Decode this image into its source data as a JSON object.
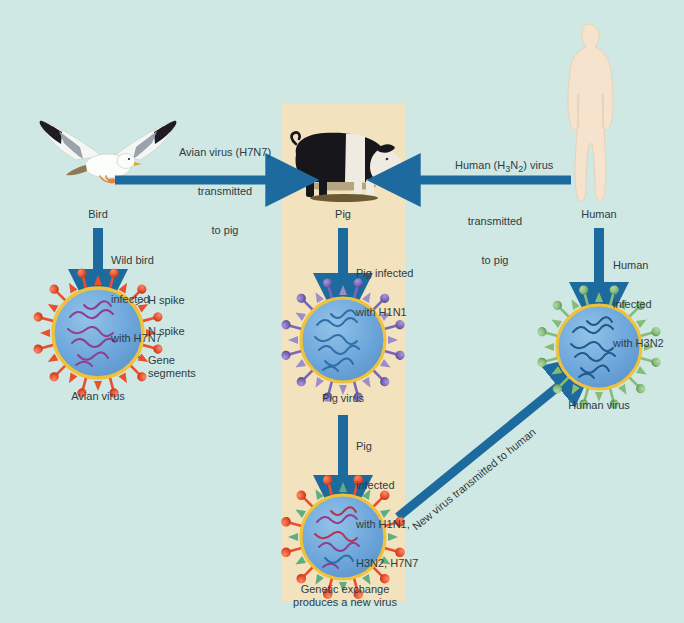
{
  "figure": {
    "background_color": "#cfe8e4",
    "panel_color": "#f2e2bd",
    "arrow_color": "#1c6a9e"
  },
  "organisms": [
    {
      "id": "bird",
      "label": "Bird",
      "icon": "seagull-icon"
    },
    {
      "id": "pig",
      "label": "Pig",
      "icon": "pig-icon"
    },
    {
      "id": "human",
      "label": "Human",
      "icon": "human-silhouette-icon"
    }
  ],
  "transmission_arrows": {
    "bird_to_pig": {
      "text_lines": [
        "Avian virus (H7N7)",
        "transmitted",
        "to pig"
      ],
      "direction": "right"
    },
    "human_to_pig": {
      "text_lines": [
        "Human (H",
        "3",
        "N",
        "2",
        ") virus",
        "transmitted",
        "to pig"
      ],
      "line1_pre": "Human (H",
      "line1_sub1": "3",
      "line1_mid": "N",
      "line1_sub2": "2",
      "line1_post": ") virus",
      "line2": "transmitted",
      "line3": "to pig",
      "direction": "left"
    },
    "new_virus_to_human": {
      "text": "New virus transmitted to human",
      "direction": "diagonal-up-right"
    }
  },
  "infection_steps": [
    {
      "id": "bird-infection",
      "text_lines": [
        "Wild bird",
        "infected",
        "with H7N7"
      ]
    },
    {
      "id": "pig-infection",
      "text_lines": [
        "Pig infected",
        "with H1N1"
      ]
    },
    {
      "id": "human-infection",
      "text_lines": [
        "Human",
        "infected",
        "with H3N2"
      ]
    },
    {
      "id": "reassortment",
      "text_lines": [
        "Pig",
        "infected",
        "with H1N1,",
        "H3N2, H7N7"
      ]
    }
  ],
  "viruses": [
    {
      "id": "avian-virus",
      "caption_lines": [
        "Avian virus"
      ],
      "h_spike_color": "#e8502e",
      "n_spike_color": "#e8502e",
      "envelope_color": "#6fa8dc",
      "ring_color": "#f0c23a",
      "gene_color": "#8e3f8e"
    },
    {
      "id": "pig-virus",
      "caption_lines": [
        "Pig virus"
      ],
      "h_spike_color": "#7b68b5",
      "n_spike_color": "#9b8ccb",
      "envelope_color": "#6fa8dc",
      "ring_color": "#f0c23a",
      "gene_color": "#2f6fa8"
    },
    {
      "id": "human-virus",
      "caption_lines": [
        "Human virus"
      ],
      "h_spike_color": "#86bb7a",
      "n_spike_color": "#86bb7a",
      "envelope_color": "#6fa8dc",
      "ring_color": "#f0c23a",
      "gene_color": "#1f5a8a"
    },
    {
      "id": "new-virus",
      "caption_lines": [
        "Genetic exchange",
        "produces a new virus"
      ],
      "h_spike_color": "#e8502e",
      "n_spike_color": "#5eae84",
      "envelope_color": "#6fa8dc",
      "ring_color": "#f0c23a",
      "gene_color": "#8e3f8e"
    }
  ],
  "callouts": [
    {
      "id": "h-spike",
      "label": "H spike"
    },
    {
      "id": "n-spike",
      "label": "N spike"
    },
    {
      "id": "gene-segments",
      "label": "Gene\nsegments"
    }
  ]
}
